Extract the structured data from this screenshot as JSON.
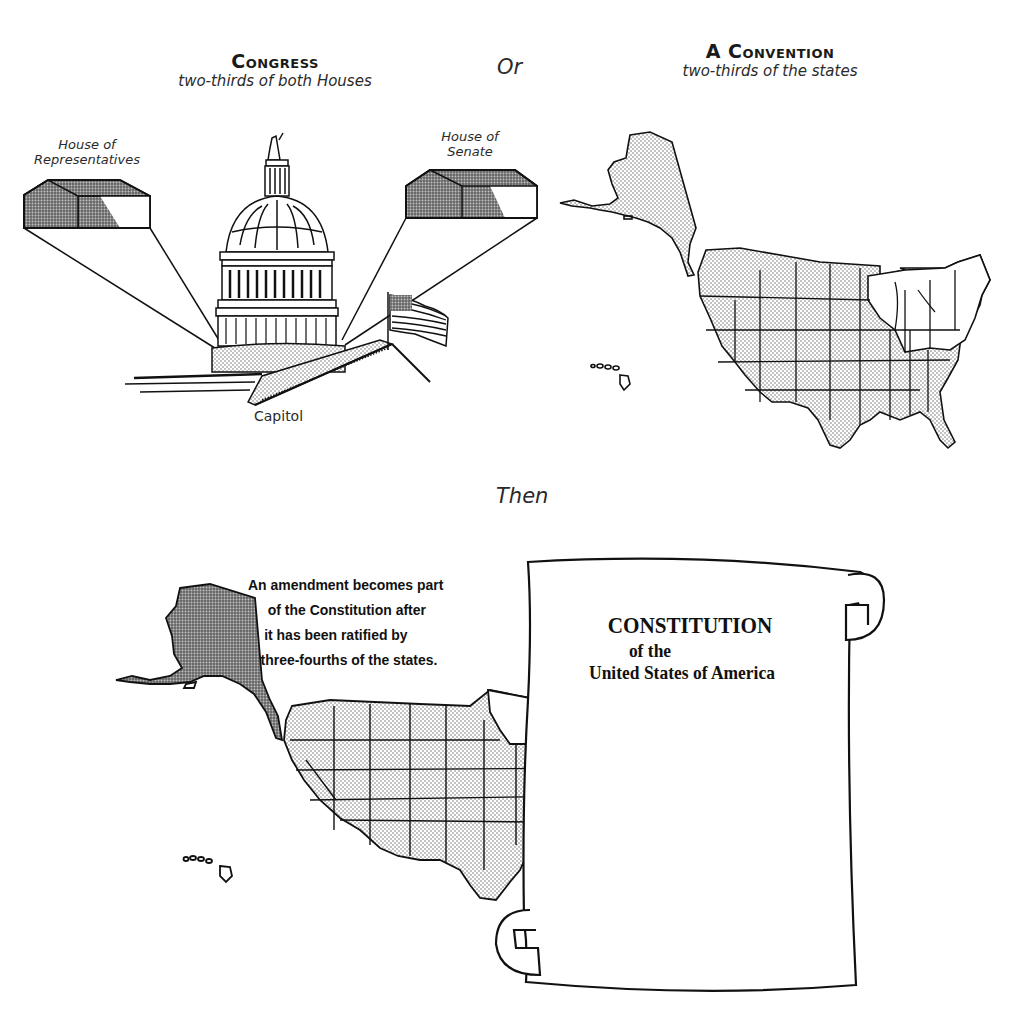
{
  "top_left": {
    "heading": "Congress",
    "subheading": "two-thirds of both Houses",
    "labels": {
      "house_left": [
        "House of",
        "Representatives"
      ],
      "house_right": [
        "House of",
        "Senate"
      ],
      "building": "Capitol"
    }
  },
  "connector_or": "Or",
  "top_right": {
    "heading": "A Convention",
    "subheading": "two-thirds of the states"
  },
  "connector_then": "Then",
  "bottom": {
    "amendment_text": [
      "An amendment becomes part",
      "of the Constitution  after",
      "it has been ratified by",
      "three-fourths of the states."
    ],
    "scroll": {
      "title": "CONSTITUTION",
      "line2": "of  the",
      "line3": "United States of America"
    }
  },
  "colors": {
    "ink": "#1a1a1a",
    "stipple": "#c8c8c8",
    "paper": "#ffffff"
  }
}
